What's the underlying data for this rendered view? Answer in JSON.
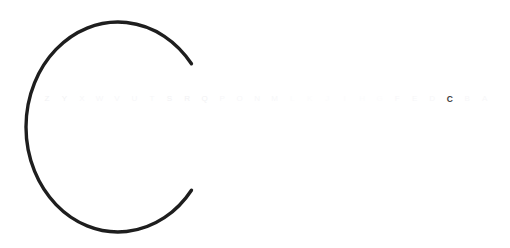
{
  "canvas": {
    "width": 510,
    "height": 248,
    "background_color": "#ffffff"
  },
  "glyph": {
    "character": "C",
    "stroke_color": "#1e1e1e",
    "stroke_width": 3.4,
    "description": "large thin-stroke outline capital C",
    "center_x": 118,
    "center_y": 127,
    "radius_x": 92,
    "radius_y": 105,
    "gap_start_angle": -37,
    "gap_end_angle": 37
  },
  "alphabet_strip": {
    "base_color": "#f7f7f9",
    "active_color": "#3c3c3c",
    "active_letter": "C",
    "active_index": 23,
    "letters": [
      {
        "label": "Z",
        "level": 3
      },
      {
        "label": "Y",
        "level": 3
      },
      {
        "label": "X",
        "level": 2
      },
      {
        "label": "W",
        "level": 2
      },
      {
        "label": "V",
        "level": 2
      },
      {
        "label": "U",
        "level": 2
      },
      {
        "label": "T",
        "level": 2
      },
      {
        "label": "S",
        "level": 3
      },
      {
        "label": "R",
        "level": 3
      },
      {
        "label": "Q",
        "level": 3
      },
      {
        "label": "P",
        "level": 2
      },
      {
        "label": "O",
        "level": 2
      },
      {
        "label": "N",
        "level": 2
      },
      {
        "label": "M",
        "level": 2
      },
      {
        "label": "L",
        "level": 1
      },
      {
        "label": "K",
        "level": 1
      },
      {
        "label": "J",
        "level": 1
      },
      {
        "label": "I",
        "level": 1
      },
      {
        "label": "H",
        "level": 1
      },
      {
        "label": "G",
        "level": 1
      },
      {
        "label": "F",
        "level": 2
      },
      {
        "label": "E",
        "level": 2
      },
      {
        "label": "D",
        "level": 2
      },
      {
        "label": "C",
        "level": 0
      },
      {
        "label": "B",
        "level": 2
      },
      {
        "label": "A",
        "level": 2
      }
    ]
  }
}
